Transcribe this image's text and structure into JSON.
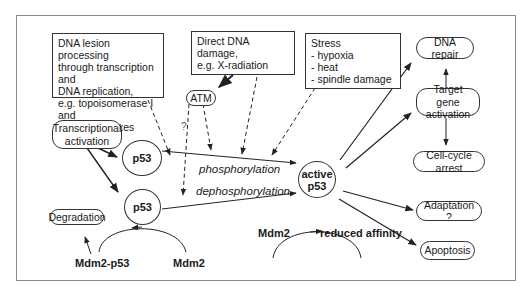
{
  "boxes": {
    "dna_lesion": "DNA lesion processing\nthrough transcription and\nDNA replication,\ne.g. topoisomerase I and\nCPT comlplexes",
    "direct_damage": "Direct DNA damage,\ne.g.  X-radiation",
    "stress": "Stress\n- hypoxia\n- heat\n- spindle damage"
  },
  "nodes": {
    "atm": "ATM",
    "transcriptional_activation": "Transcriptional\nactivation",
    "p53_top": "p53",
    "p53_bottom": "p53",
    "active_p53": "active\np53",
    "degradation": "Degradation",
    "dna_repair": "DNA repair",
    "target_gene_activation": "Target gene\nactivation",
    "cell_cycle_arrest": "Cell-cycle arrest",
    "adaptation": "Adaptation ?",
    "apoptosis": "Apoptosis"
  },
  "labels": {
    "phosphorylation": "phosphorylation",
    "dephosphorylation": "dephosphorylation",
    "question": "?",
    "mdm2_p53": "Mdm2-p53",
    "mdm2_left": "Mdm2",
    "mdm2_right": "Mdm2",
    "reduced_affinity": "reduced affinity"
  },
  "colors": {
    "line": "#222222",
    "frame": "#8a8a8a"
  }
}
